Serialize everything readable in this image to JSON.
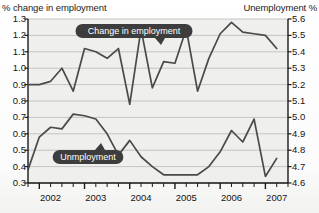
{
  "chart_data": {
    "type": "line",
    "title": "",
    "xlabel": "",
    "ylabel": "% change in employment",
    "y2label": "Unemployment %",
    "grid": true,
    "legend_position": "inline-callouts",
    "xlim": [
      2001.75,
      2007.5
    ],
    "ylim": [
      0.3,
      1.3
    ],
    "y2lim": [
      4.6,
      5.6
    ],
    "x_tick_labels": [
      "2002",
      "2003",
      "2004",
      "2005",
      "2006",
      "2007"
    ],
    "x_tick_values": [
      2002,
      2003,
      2004,
      2005,
      2006,
      2007
    ],
    "x_minor_tick_interval": 0.25,
    "y_tick_labels": [
      "1.3",
      "1.2",
      "1.1",
      "1.0",
      "0.9",
      "0.8",
      "0.7",
      "0.6",
      "0.5",
      "0.4",
      "0.3"
    ],
    "y_tick_values": [
      1.3,
      1.2,
      1.1,
      1.0,
      0.9,
      0.8,
      0.7,
      0.6,
      0.5,
      0.4,
      0.3
    ],
    "y2_tick_labels": [
      "5.6",
      "5.5",
      "5.4",
      "5.3",
      "5.2",
      "5.1",
      "5.0",
      "4.9",
      "4.8",
      "4.7",
      "4.6"
    ],
    "y2_tick_values": [
      5.6,
      5.5,
      5.4,
      5.3,
      5.2,
      5.1,
      5.0,
      4.9,
      4.8,
      4.7,
      4.6
    ],
    "series": [
      {
        "name": "Change in employment",
        "axis": "left",
        "color": "#4a4a4a",
        "x": [
          2001.75,
          2002.0,
          2002.25,
          2002.5,
          2002.75,
          2003.0,
          2003.25,
          2003.5,
          2003.75,
          2004.0,
          2004.25,
          2004.5,
          2004.75,
          2005.0,
          2005.25,
          2005.5,
          2005.75,
          2006.0,
          2006.25,
          2006.5,
          2006.75,
          2007.0,
          2007.25
        ],
        "values": [
          0.9,
          0.9,
          0.92,
          1.0,
          0.86,
          1.12,
          1.1,
          1.06,
          1.12,
          0.78,
          1.24,
          0.88,
          1.04,
          1.03,
          1.24,
          0.86,
          1.06,
          1.21,
          1.28,
          1.22,
          1.21,
          1.2,
          1.12
        ]
      },
      {
        "name": "Unmployment",
        "axis": "right",
        "color": "#4a4a4a",
        "x": [
          2001.75,
          2002.0,
          2002.25,
          2002.5,
          2002.75,
          2003.0,
          2003.25,
          2003.5,
          2003.75,
          2004.0,
          2004.25,
          2004.5,
          2004.75,
          2005.0,
          2005.25,
          2005.5,
          2005.75,
          2006.0,
          2006.25,
          2006.5,
          2006.75,
          2007.0,
          2007.25
        ],
        "values": [
          4.68,
          4.88,
          4.94,
          4.93,
          5.02,
          5.01,
          4.99,
          4.9,
          4.77,
          4.86,
          4.76,
          4.7,
          4.65,
          4.65,
          4.65,
          4.65,
          4.7,
          4.79,
          4.92,
          4.85,
          4.99,
          4.64,
          4.75
        ]
      }
    ],
    "annotations": [
      {
        "name": "change-in-employment-callout",
        "label": "Change in employment",
        "points_to_series": "Change in employment"
      },
      {
        "name": "unemployment-callout",
        "label": "Unmployment",
        "points_to_series": "Unmployment"
      }
    ],
    "colors": {
      "line": "#4a4a4a",
      "gridline": "#b9b9b9",
      "axis": "#1a1a1a",
      "plot_background": "#efefed",
      "callout_background": "#3d3d3d",
      "callout_text": "#ffffff"
    }
  }
}
